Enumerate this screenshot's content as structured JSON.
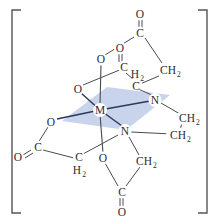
{
  "figure": {
    "bracket_left": "[",
    "bracket_right": "]",
    "colors": {
      "plane_fill": "#b9c8e6",
      "bond": "#4a4a52",
      "plane_bond": "#2b3a5c",
      "label": "#2d2d33",
      "bracket": "#55555d",
      "background": "#ffffff"
    }
  },
  "atoms": {
    "metal_center": "M",
    "nitrogen_upper": "N",
    "nitrogen_lower": "N",
    "oxygen_equatorial_upper_left": "O",
    "oxygen_equatorial_left": "O",
    "oxygen_axial_upper": "O",
    "oxygen_axial_lower": "O",
    "carbonyl_oxygen_top": "O",
    "carbonyl_oxygen_upper_mid": "O",
    "carbonyl_oxygen_left": "O",
    "carbonyl_oxygen_bottom": "O",
    "carbon_top": "C",
    "carbon_upper_mid": "C",
    "carbon_left": "C",
    "carbon_bottom": "C",
    "methylene_upper_right": "CH",
    "methylene_upper_right_sub": "2",
    "methylene_inner_upper": "C",
    "methylene_inner_upper_sub": "H",
    "methylene_inner_upper_sub2": "2",
    "methylene_bridge_top": "CH",
    "methylene_bridge_top_sub": "2",
    "methylene_bridge_bottom": "CH",
    "methylene_bridge_bottom_sub": "2",
    "methylene_lower_left": "C",
    "methylene_lower_left_sub": "H",
    "methylene_lower_left_sub2": "2",
    "methylene_lower_right": "CH",
    "methylene_lower_right_sub": "2"
  }
}
